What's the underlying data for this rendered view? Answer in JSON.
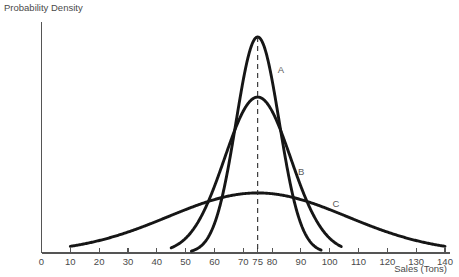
{
  "chart_data": {
    "type": "line",
    "title": "",
    "subtitle": "",
    "xlabel": "Sales (Tons)",
    "ylabel": "Probability Density",
    "xlim": [
      0,
      140
    ],
    "ylim": [
      0,
      1
    ],
    "grid": false,
    "legend_position": "inline-annotations",
    "x_ticks": [
      0,
      10,
      20,
      30,
      40,
      50,
      60,
      70,
      75,
      80,
      90,
      100,
      110,
      120,
      130,
      140
    ],
    "x_tick_labels": [
      "0",
      "10",
      "20",
      "30",
      "40",
      "50",
      "60",
      "70",
      "75",
      "80",
      "90",
      "100",
      "110",
      "120",
      "130",
      "140"
    ],
    "y_ticks": [],
    "y_tick_labels": [],
    "annotations": [
      {
        "text": "A",
        "x": 82,
        "y": 0.78,
        "describes": "narrow-tall-curve"
      },
      {
        "text": "B",
        "x": 89,
        "y": 0.34,
        "describes": "medium-curve"
      },
      {
        "text": "C",
        "x": 101,
        "y": 0.2,
        "describes": "broad-flat-curve"
      }
    ],
    "reference_lines": [
      {
        "orientation": "vertical",
        "x": 75,
        "style": "dashed",
        "label": "75"
      }
    ],
    "series": [
      {
        "name": "A",
        "mean": 75,
        "std_dev": 7.5,
        "peak_density": 0.935,
        "description": "narrow tall normal curve, smallest variance",
        "x_start": 52,
        "x_end": 97
      },
      {
        "name": "B",
        "mean": 75,
        "std_dev": 11.5,
        "peak_density": 0.675,
        "description": "medium width normal curve",
        "x_start": 45,
        "x_end": 104
      },
      {
        "name": "C",
        "mean": 75,
        "std_dev": 31,
        "peak_density": 0.26,
        "description": "broad flat normal curve, largest variance",
        "x_start": 10,
        "x_end": 140
      }
    ]
  },
  "axes": {
    "y_axis_title": "Probability Density",
    "x_axis_title": "Sales (Tons)"
  },
  "curve_labels": {
    "a": "A",
    "b": "B",
    "c": "C"
  },
  "colors": {
    "curve_stroke": "#161616",
    "axis_stroke": "#555555",
    "text": "#4a4a4a",
    "background": "#ffffff"
  }
}
